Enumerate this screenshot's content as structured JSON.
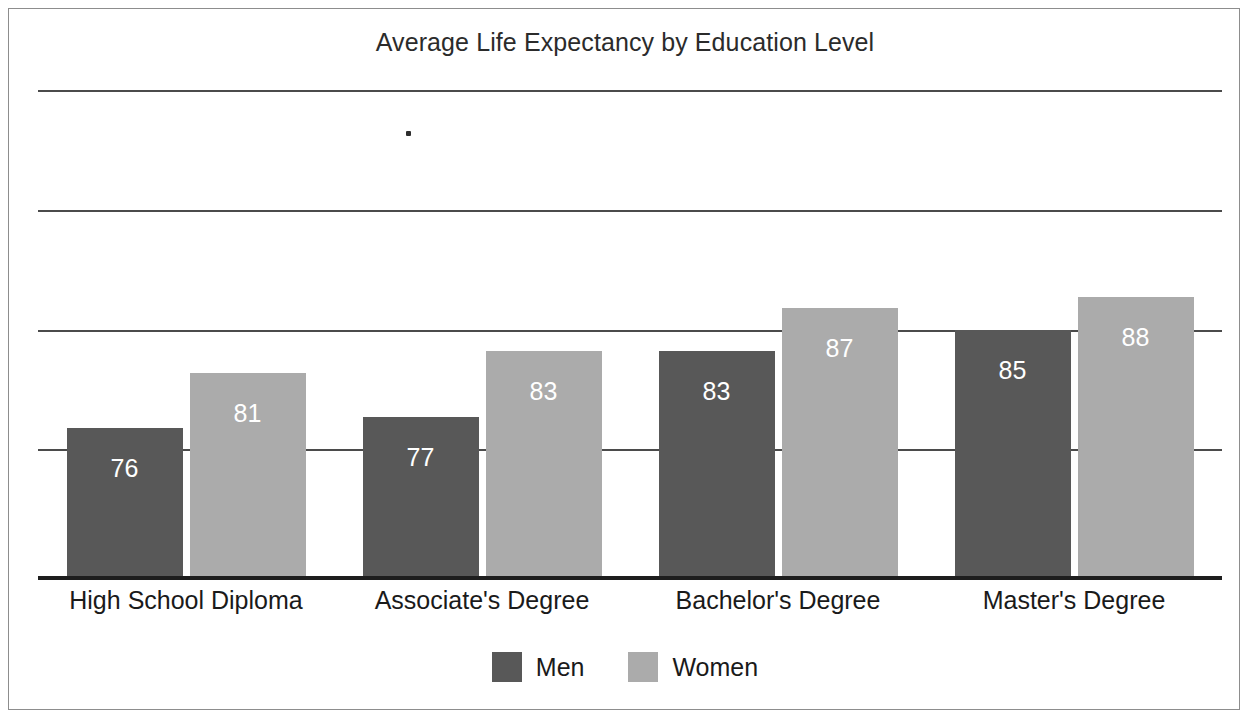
{
  "chart_data": {
    "type": "bar",
    "title": "Average Life Expectancy by Education Level",
    "xlabel": "",
    "ylabel": "",
    "categories": [
      "High School Diploma",
      "Associate's Degree",
      "Bachelor's Degree",
      "Master's Degree"
    ],
    "series": [
      {
        "name": "Men",
        "color": "#585858",
        "values": [
          76,
          77,
          83,
          85
        ]
      },
      {
        "name": "Women",
        "color": "#ababab",
        "values": [
          81,
          83,
          87,
          88
        ]
      }
    ],
    "value_labels": {
      "men": [
        "76",
        "77",
        "83",
        "85"
      ],
      "women": [
        "81",
        "83",
        "87",
        "88"
      ]
    },
    "ylim": [
      62,
      107
    ],
    "gridlines": [
      107,
      96,
      85,
      74
    ],
    "grid": true,
    "tick_labels_visible": false,
    "legend": {
      "position": "bottom-center",
      "entries": [
        {
          "label": "Men",
          "color": "#585858"
        },
        {
          "label": "Women",
          "color": "#ababab"
        }
      ]
    },
    "frame": {
      "border_color": "#8d8d8d"
    },
    "axis": {
      "baseline_color": "#1e1e1e",
      "gridline_color": "#4b4b4b"
    }
  },
  "colors": {
    "men": "#585858",
    "women": "#ababab",
    "background": "#ffffff",
    "text": "#1a1a1a",
    "title": "#2b2b2b",
    "border": "#8d8d8d",
    "axis": "#1e1e1e",
    "grid": "#4b4b4b",
    "value_label": "#ffffff"
  }
}
